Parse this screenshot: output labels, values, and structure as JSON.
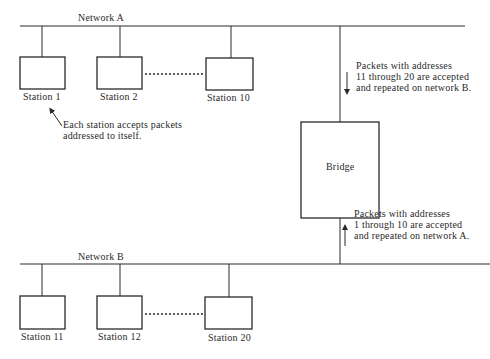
{
  "networks": [
    {
      "id": "A",
      "label": "Network A"
    },
    {
      "id": "B",
      "label": "Network B"
    }
  ],
  "stations": {
    "network_a": [
      {
        "label": "Station 1"
      },
      {
        "label": "Station 2"
      },
      {
        "label": "Station 10"
      }
    ],
    "network_b": [
      {
        "label": "Station 11"
      },
      {
        "label": "Station 12"
      },
      {
        "label": "Station 20"
      }
    ]
  },
  "bridge": {
    "label": "Bridge"
  },
  "annotations": {
    "station_note": {
      "lines": [
        "Each station accepts packets",
        "addressed to itself."
      ]
    },
    "a_to_b": {
      "direction": "down",
      "lines": [
        "Packets with addresses",
        "11 through 20 are accepted",
        "and repeated on network B."
      ]
    },
    "b_to_a": {
      "direction": "up",
      "lines": [
        "Packets with addresses",
        "1 through 10 are accepted",
        "and repeated on network A."
      ]
    }
  },
  "colors": {
    "line": "#2a2a2a",
    "background": "#ffffff"
  }
}
